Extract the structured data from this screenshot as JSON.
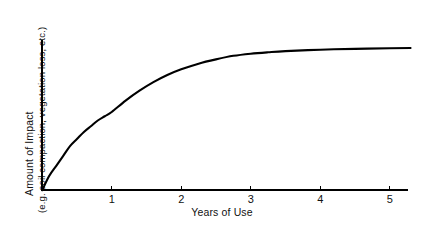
{
  "chart_data": {
    "type": "line",
    "title": "",
    "subtitle": "",
    "xlabel": "Years of Use",
    "ylabel_line1": "Amount of Impact",
    "ylabel_line2": "(e.g. soil compaction, vegetation loss, etc.)",
    "xlim": [
      0,
      5.3
    ],
    "ylim": [
      0,
      1.05
    ],
    "grid": false,
    "legend": null,
    "xticks": [
      1,
      2,
      3,
      4,
      5
    ],
    "xtick_labels": [
      "1",
      "2",
      "3",
      "4",
      "5"
    ],
    "yticks": [],
    "ytick_labels": [],
    "annotations": [],
    "series": [
      {
        "name": "Impact",
        "color": "#000000",
        "x": [
          0,
          0.1,
          0.2,
          0.3,
          0.4,
          0.5,
          0.6,
          0.7,
          0.8,
          0.9,
          1.0,
          1.2,
          1.4,
          1.6,
          1.8,
          2.0,
          2.25,
          2.5,
          2.75,
          3.0,
          3.25,
          3.5,
          4.0,
          4.5,
          5.0,
          5.3
        ],
        "y": [
          0.0,
          0.1,
          0.17,
          0.24,
          0.31,
          0.36,
          0.41,
          0.45,
          0.49,
          0.52,
          0.55,
          0.63,
          0.7,
          0.76,
          0.81,
          0.85,
          0.89,
          0.92,
          0.945,
          0.96,
          0.97,
          0.978,
          0.988,
          0.994,
          0.998,
          1.0
        ]
      }
    ]
  },
  "colors": {
    "background": "#ffffff",
    "axis": "#000000",
    "curve": "#000000",
    "text": "#111111"
  }
}
